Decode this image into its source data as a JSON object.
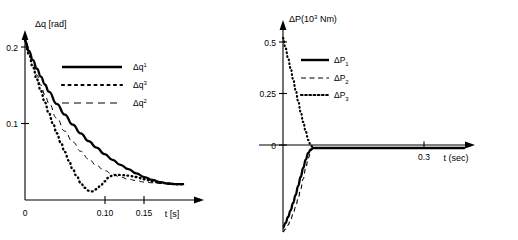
{
  "figure": {
    "background": "#ffffff",
    "ink_color": "#000000",
    "panel_count": 2
  },
  "chart_data": [
    {
      "type": "line",
      "panel": "left",
      "title": "",
      "ylabel": "Δq [rad]",
      "xlabel": "t [s]",
      "xlim": [
        0,
        0.215
      ],
      "ylim": [
        -0.022,
        0.215
      ],
      "grid": false,
      "legend_position": "upper-center",
      "x_ticks": [
        0,
        0.1,
        0.15
      ],
      "x_tick_labels": [
        "0",
        "0.10",
        "0.15"
      ],
      "y_ticks": [
        0.1,
        0.2
      ],
      "y_tick_labels": [
        "0.1",
        "0.2"
      ],
      "series": [
        {
          "name": "Δq¹",
          "legend_label_base": "Δq",
          "legend_label_sup": "1",
          "style": "solid",
          "x": [
            0,
            0.005,
            0.01,
            0.015,
            0.02,
            0.025,
            0.03,
            0.04,
            0.05,
            0.06,
            0.07,
            0.08,
            0.09,
            0.1,
            0.11,
            0.12,
            0.13,
            0.14,
            0.15,
            0.16,
            0.17,
            0.18,
            0.19,
            0.2
          ],
          "y": [
            0.2,
            0.186,
            0.173,
            0.161,
            0.15,
            0.139,
            0.129,
            0.112,
            0.097,
            0.083,
            0.071,
            0.06,
            0.051,
            0.042,
            0.034,
            0.027,
            0.021,
            0.015,
            0.01,
            0.006,
            0.003,
            0.001,
            0.0,
            0.0
          ]
        },
        {
          "name": "Δq³",
          "legend_label_base": "Δq",
          "legend_label_sup": "3",
          "style": "dotted",
          "x": [
            0,
            0.005,
            0.01,
            0.015,
            0.02,
            0.025,
            0.03,
            0.035,
            0.04,
            0.045,
            0.05,
            0.055,
            0.06,
            0.065,
            0.07,
            0.075,
            0.08,
            0.085,
            0.09,
            0.095,
            0.1,
            0.105,
            0.11,
            0.115,
            0.12,
            0.13,
            0.14,
            0.15,
            0.16,
            0.17,
            0.18,
            0.19,
            0.2
          ],
          "y": [
            0.2,
            0.181,
            0.163,
            0.146,
            0.13,
            0.114,
            0.099,
            0.085,
            0.071,
            0.058,
            0.045,
            0.033,
            0.021,
            0.011,
            0.002,
            -0.005,
            -0.009,
            -0.01,
            -0.007,
            -0.002,
            0.004,
            0.009,
            0.012,
            0.013,
            0.013,
            0.012,
            0.01,
            0.007,
            0.004,
            0.002,
            0.001,
            0.0,
            0.0
          ]
        },
        {
          "name": "Δq²",
          "legend_label_base": "Δq",
          "legend_label_sup": "2",
          "style": "dashed",
          "x": [
            0,
            0.005,
            0.01,
            0.015,
            0.02,
            0.025,
            0.03,
            0.04,
            0.05,
            0.06,
            0.07,
            0.08,
            0.09,
            0.1,
            0.11,
            0.12,
            0.13,
            0.14,
            0.15,
            0.16,
            0.17,
            0.18,
            0.19,
            0.2
          ],
          "y": [
            0.2,
            0.183,
            0.167,
            0.152,
            0.138,
            0.125,
            0.113,
            0.092,
            0.074,
            0.059,
            0.046,
            0.035,
            0.026,
            0.019,
            0.014,
            0.01,
            0.007,
            0.005,
            0.003,
            0.002,
            0.001,
            0.0,
            0.0,
            0.0
          ]
        }
      ]
    },
    {
      "type": "line",
      "panel": "right",
      "title": "",
      "ylabel_base": "ΔP(10",
      "ylabel_sup": "3",
      "ylabel_tail": " Nm)",
      "ylabel": "ΔP(10³ Nm)",
      "xlabel": "t (sec)",
      "xlim": [
        0,
        0.38
      ],
      "ylim": [
        -0.42,
        0.6
      ],
      "grid": false,
      "legend_position": "upper-center",
      "x_ticks": [
        0.3
      ],
      "x_tick_labels": [
        "0.3"
      ],
      "y_ticks": [
        0,
        0.25,
        0.5
      ],
      "y_tick_labels": [
        "0",
        "0.25",
        "0.5"
      ],
      "series": [
        {
          "name": "ΔP₁",
          "legend_label_base": "ΔP",
          "legend_label_sub": "1",
          "style": "solid",
          "x": [
            0,
            0.005,
            0.01,
            0.015,
            0.02,
            0.025,
            0.03,
            0.035,
            0.04,
            0.045,
            0.05,
            0.055,
            0.06,
            0.08,
            0.12,
            0.18,
            0.25,
            0.32,
            0.36
          ],
          "y": [
            -0.4,
            -0.375,
            -0.345,
            -0.312,
            -0.275,
            -0.235,
            -0.19,
            -0.145,
            -0.1,
            -0.058,
            -0.025,
            -0.007,
            0.0,
            0.0,
            0.0,
            0.0,
            0.0,
            0.0,
            0.0
          ]
        },
        {
          "name": "ΔP₂",
          "legend_label_base": "ΔP",
          "legend_label_sub": "2",
          "style": "dashed",
          "x": [
            0,
            0.005,
            0.01,
            0.015,
            0.02,
            0.025,
            0.03,
            0.035,
            0.04,
            0.045,
            0.05,
            0.055,
            0.06,
            0.08,
            0.12,
            0.18,
            0.25,
            0.32,
            0.36
          ],
          "y": [
            -0.42,
            -0.405,
            -0.385,
            -0.36,
            -0.33,
            -0.295,
            -0.253,
            -0.205,
            -0.155,
            -0.1,
            -0.05,
            -0.013,
            0.0,
            0.0,
            0.0,
            0.0,
            0.0,
            0.0,
            0.0
          ]
        },
        {
          "name": "ΔP₃",
          "legend_label_base": "ΔP",
          "legend_label_sub": "3",
          "style": "dotted",
          "x": [
            0,
            0.005,
            0.01,
            0.015,
            0.02,
            0.025,
            0.03,
            0.035,
            0.04,
            0.045,
            0.05,
            0.055,
            0.06,
            0.08,
            0.12,
            0.18,
            0.25,
            0.32,
            0.36
          ],
          "y": [
            0.55,
            0.5,
            0.45,
            0.4,
            0.345,
            0.29,
            0.235,
            0.18,
            0.13,
            0.082,
            0.04,
            0.012,
            0.0,
            0.0,
            0.0,
            0.0,
            0.0,
            0.0,
            0.0
          ]
        }
      ]
    }
  ]
}
